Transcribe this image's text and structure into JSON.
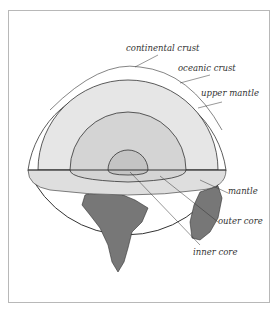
{
  "diagram": {
    "title": "",
    "labels": {
      "continental_crust": "continental crust",
      "oceanic_crust": "oceanic crust",
      "upper_mantle": "upper mantle",
      "mantle": "mantle",
      "outer_core": "outer core",
      "inner_core": "inner core"
    },
    "colors": {
      "outline": "#333333",
      "upper_mantle_fill": "#e6e6e6",
      "mantle_fill": "#dadada",
      "outer_core_fill": "#d0d0d0",
      "inner_core_fill": "#c4c4c4",
      "continent_fill": "#777777",
      "frame": "#b8b8b8"
    }
  }
}
